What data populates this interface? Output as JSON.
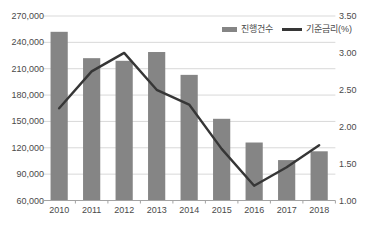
{
  "chart_data": {
    "type": "bar",
    "subtype": "combo-bar-line",
    "categories": [
      "2010",
      "2011",
      "2012",
      "2013",
      "2014",
      "2015",
      "2016",
      "2017",
      "2018"
    ],
    "series": [
      {
        "name": "진행건수",
        "type": "bar",
        "axis": "left",
        "color": "#858585",
        "values": [
          252000,
          222000,
          219000,
          229000,
          203000,
          153000,
          126000,
          106000,
          116000
        ]
      },
      {
        "name": "기준금리(%)",
        "type": "line",
        "axis": "right",
        "color": "#363636",
        "values": [
          2.25,
          2.75,
          3.0,
          2.5,
          2.3,
          1.7,
          1.2,
          1.45,
          1.75
        ]
      }
    ],
    "left_axis": {
      "min": 60000,
      "max": 270000,
      "step": 30000,
      "tick_labels": [
        "60,000",
        "90,000",
        "120,000",
        "150,000",
        "180,000",
        "210,000",
        "240,000",
        "270,000"
      ]
    },
    "right_axis": {
      "min": 1.0,
      "max": 3.5,
      "step": 0.5,
      "tick_labels": [
        "1.00",
        "1.50",
        "2.00",
        "2.50",
        "3.00",
        "3.50"
      ]
    },
    "grid": true,
    "legend_position": "top-right",
    "colors": {
      "grid": "#d9d9d9",
      "axis": "#a3a3a3",
      "text": "#4a4a4a",
      "background": "#ffffff"
    }
  }
}
